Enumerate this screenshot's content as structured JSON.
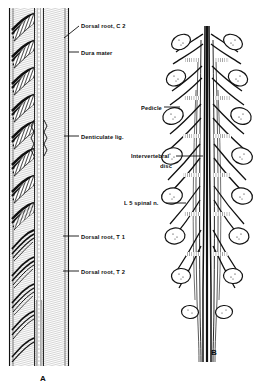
{
  "figure": {
    "background_color": "#ffffff",
    "ink_color": "#0d0d0d",
    "disc_color": "#9a9a9a"
  },
  "panels": [
    {
      "id": "A",
      "letter": "A",
      "letter_x": 40,
      "letter_y": 374,
      "description": "Cervical and upper thoracic spinal cord with dorsal roots, dura mater and denticulate ligament"
    },
    {
      "id": "B",
      "letter": "B",
      "letter_x": 211,
      "letter_y": 348,
      "description": "Lumbosacral cauda equina with pedicles, intervertebral discs and L5 spinal nerve"
    }
  ],
  "labels": [
    {
      "id": "dorsal-root-c2",
      "text": "Dorsal root, C 2",
      "x": 81,
      "y": 22,
      "align": "left",
      "leader": {
        "x1": 79,
        "y1": 26,
        "x2": 64,
        "y2": 38
      }
    },
    {
      "id": "dura-mater",
      "text": "Dura mater",
      "x": 81,
      "y": 49,
      "align": "left",
      "leader": {
        "x1": 79,
        "y1": 52,
        "x2": 68,
        "y2": 52
      }
    },
    {
      "id": "denticulate-lig",
      "text": "Denticulate lig.",
      "x": 81,
      "y": 133,
      "align": "left",
      "leader": {
        "x1": 79,
        "y1": 136,
        "x2": 64,
        "y2": 136
      }
    },
    {
      "id": "dorsal-root-t1",
      "text": "Dorsal root, T 1",
      "x": 81,
      "y": 233,
      "align": "left",
      "leader": {
        "x1": 79,
        "y1": 236,
        "x2": 63,
        "y2": 236
      }
    },
    {
      "id": "dorsal-root-t2",
      "text": "Dorsal root, T 2",
      "x": 81,
      "y": 268,
      "align": "left",
      "leader": {
        "x1": 79,
        "y1": 271,
        "x2": 63,
        "y2": 271
      }
    },
    {
      "id": "pedicle",
      "text": "Pedicle",
      "x": 141,
      "y": 104,
      "align": "left",
      "leader": {
        "x1": 164,
        "y1": 107,
        "x2": 180,
        "y2": 107
      }
    },
    {
      "id": "intervertebral-disc-line1",
      "text": "Intervertebral",
      "x": 131,
      "y": 152,
      "align": "left",
      "leader": {
        "x1": 176,
        "y1": 156,
        "x2": 203,
        "y2": 156
      }
    },
    {
      "id": "intervertebral-disc-line2",
      "text": "disc",
      "x": 160,
      "y": 162,
      "align": "left",
      "leader": null
    },
    {
      "id": "l5-spinal-n",
      "text": "L 5 spinal n.",
      "x": 124,
      "y": 199,
      "align": "left",
      "leader": {
        "x1": 166,
        "y1": 203,
        "x2": 186,
        "y2": 203
      }
    }
  ]
}
